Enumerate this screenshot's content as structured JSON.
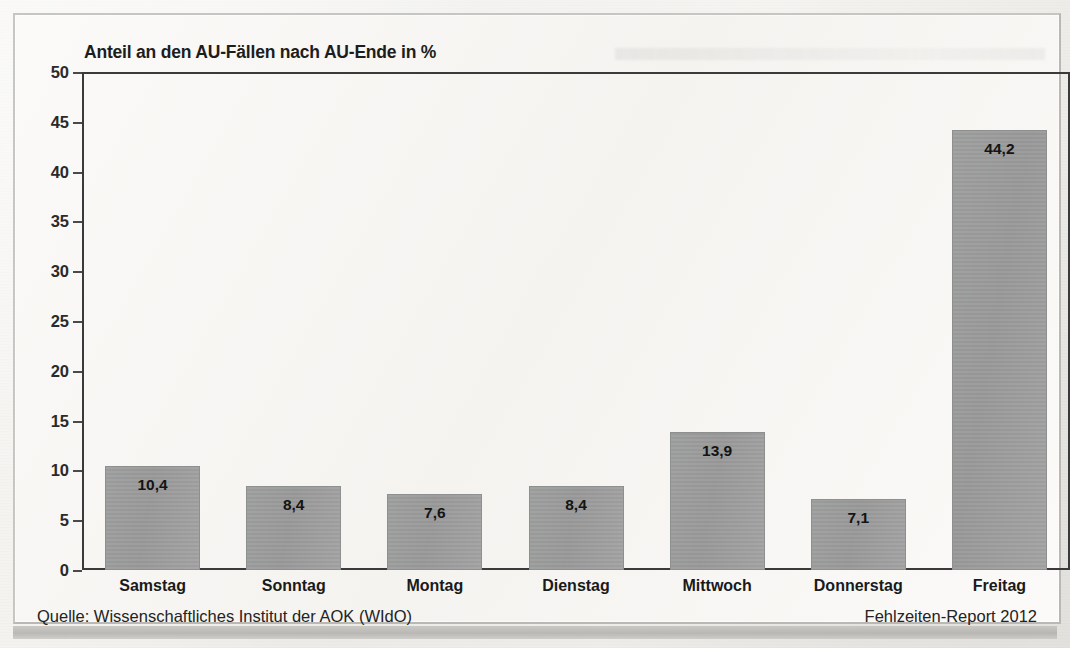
{
  "figure": {
    "title": "Anteil an den AU-Fällen nach AU-Ende in %",
    "source_note": "Quelle: Wissenschaftliches Institut der AOK (WIdO)",
    "report_note": "Fehlzeiten-Report 2012",
    "bar_color": "#9a9b9b",
    "frame_color": "#b9b8b4",
    "text_color": "#1d1d1d"
  },
  "chart_data": {
    "type": "bar",
    "title": "Anteil an den AU-Fällen nach AU-Ende in %",
    "xlabel": "",
    "ylabel": "",
    "categories": [
      "Samstag",
      "Sonntag",
      "Montag",
      "Dienstag",
      "Mittwoch",
      "Donnerstag",
      "Freitag"
    ],
    "values": [
      10.4,
      8.4,
      7.6,
      8.4,
      13.9,
      7.1,
      44.2
    ],
    "value_labels": [
      "10,4",
      "8,4",
      "7,6",
      "8,4",
      "13,9",
      "7,1",
      "44,2"
    ],
    "ylim": [
      0,
      50
    ],
    "yticks": [
      0,
      5,
      10,
      15,
      20,
      25,
      30,
      35,
      40,
      45,
      50
    ],
    "ytick_labels": [
      "0",
      "5",
      "10",
      "15",
      "20",
      "25",
      "30",
      "35",
      "40",
      "45",
      "50"
    ],
    "grid": false,
    "legend": null,
    "series": [
      {
        "name": "Anteil an den AU-Fällen nach AU-Ende in %",
        "values": [
          10.4,
          8.4,
          7.6,
          8.4,
          13.9,
          7.1,
          44.2
        ]
      }
    ]
  }
}
